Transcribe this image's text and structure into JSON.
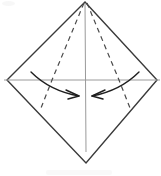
{
  "figure": {
    "kind": "origami-fold-diagram",
    "canvas": {
      "width": 161,
      "height": 176
    },
    "background_color": "#ffffff"
  },
  "colors": {
    "outline": "#3a3a3a",
    "dashed_fold": "#4a4a4a",
    "axis_guide": "#9a9a9a",
    "arrow": "#1f1f1f",
    "paper_fill": "#ffffff"
  },
  "geometry": {
    "apex": {
      "x": 85,
      "y": 2
    },
    "left_vertex": {
      "x": 7,
      "y": 80
    },
    "right_vertex": {
      "x": 157,
      "y": 80
    },
    "bottom_vertex": {
      "x": 86,
      "y": 163
    }
  },
  "shapes": {
    "diamond": {
      "name": "paper-outline",
      "points": "85,2 157,80 86,163 7,80",
      "stroke_width": 1.4,
      "style": "solid"
    },
    "horizontal_guide": {
      "name": "horizontal-crease-line",
      "x1": 4,
      "y1": 80,
      "x2": 160,
      "y2": 80,
      "stroke_width": 1,
      "style": "solid-light"
    },
    "vertical_guide": {
      "name": "vertical-crease-line",
      "x1": 85,
      "y1": 3,
      "x2": 86,
      "y2": 152,
      "stroke_width": 1,
      "style": "solid-light"
    }
  },
  "fold_lines": [
    {
      "name": "left-valley-fold",
      "label": "left dashed fold",
      "path": "M 84 3 L 52 80 L 41 108",
      "dash_pattern": "5,4",
      "stroke_width": 1.2
    },
    {
      "name": "right-valley-fold",
      "label": "right dashed fold",
      "path": "M 87 3 L 119 80 L 130 108",
      "dash_pattern": "5,4",
      "stroke_width": 1.2
    }
  ],
  "arrows": [
    {
      "name": "left-fold-arrow",
      "direction": "right-inward",
      "description": "curved arrow sweeping from upper-left toward center",
      "path": "M 31 72 C 44 85, 62 93, 79 96",
      "head": "M 79 96 L 66 90 M 79 96 L 68 99",
      "stroke_width": 1.4
    },
    {
      "name": "right-fold-arrow",
      "direction": "left-inward",
      "description": "curved arrow sweeping from upper-right toward center",
      "path": "M 139 72 C 126 85, 108 93, 92 96",
      "head": "M 92 96 L 105 90 M 92 96 L 103 99",
      "stroke_width": 1.4
    }
  ],
  "artifacts": [
    {
      "name": "scan-smudge-top-left",
      "visible": true
    },
    {
      "name": "scan-smudge-bottom",
      "visible": true
    }
  ],
  "annotations": {
    "caption": ""
  }
}
